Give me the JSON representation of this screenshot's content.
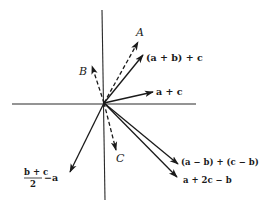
{
  "diagram": {
    "origin": {
      "x": 104,
      "y": 103
    },
    "axes": {
      "horizontal": {
        "x1": 12,
        "x2": 196,
        "y": 104
      },
      "vertical": {
        "x": 103,
        "y1": 10,
        "y2": 200
      }
    },
    "vectors": [
      {
        "id": "A",
        "style": "dashed",
        "tip": {
          "x": 138,
          "y": 42
        },
        "label": "A",
        "label_style": "italic",
        "label_pos": {
          "x": 137,
          "y": 36
        }
      },
      {
        "id": "a_plus_b_plus_c",
        "style": "solid",
        "tip": {
          "x": 143,
          "y": 55
        },
        "label": "(a + b) + c",
        "label_style": "bold",
        "label_pos": {
          "x": 146,
          "y": 61
        }
      },
      {
        "id": "B",
        "style": "dashed",
        "tip": {
          "x": 92,
          "y": 66
        },
        "label": "B",
        "label_style": "italic",
        "label_pos": {
          "x": 80,
          "y": 75
        }
      },
      {
        "id": "a_plus_c",
        "style": "solid",
        "tip": {
          "x": 153,
          "y": 92
        },
        "label": "a + c",
        "label_style": "bold",
        "label_pos": {
          "x": 156,
          "y": 95
        }
      },
      {
        "id": "C",
        "style": "dashed",
        "tip": {
          "x": 116,
          "y": 150
        },
        "label": "C",
        "label_style": "italic",
        "label_pos": {
          "x": 117,
          "y": 162
        }
      },
      {
        "id": "a_minus_b_plus_c_minus_b",
        "style": "solid",
        "tip": {
          "x": 178,
          "y": 164
        },
        "label": "(a − b) + (c − b)",
        "label_style": "bold",
        "label_pos": {
          "x": 181,
          "y": 165
        }
      },
      {
        "id": "a_plus_2c_minus_b",
        "style": "solid",
        "tip": {
          "x": 177,
          "y": 177
        },
        "label": "a + 2c − b",
        "label_style": "bold",
        "label_pos": {
          "x": 183,
          "y": 183
        }
      },
      {
        "id": "half_b_plus_c_minus_a",
        "style": "solid",
        "tip": {
          "x": 70,
          "y": 172
        },
        "label": "−a",
        "label_style": "bold",
        "label_pos": {
          "x": 43,
          "y": 181
        }
      }
    ],
    "fraction_label": {
      "numerator": "b + c",
      "denominator": "2",
      "suffix": "−a"
    }
  }
}
